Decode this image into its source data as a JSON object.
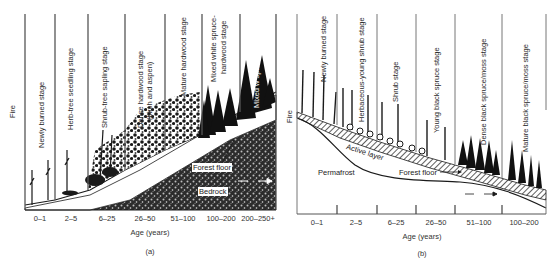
{
  "figure": {
    "panel_a": {
      "tag": "(a)",
      "fire_label": "Fire",
      "stages": [
        "Newly burned stage",
        "Herb-tree seedling stage",
        "Shrub-tree sapling stage",
        "Dense hardwood stage",
        "(birch and aspen)",
        "Mature hardwood stage",
        "Mixed white spruce-",
        "hardwood stage",
        "Mixed w spruce/moss stage"
      ],
      "age_ticks": [
        "0–1",
        "2–5",
        "6–25",
        "26–50",
        "51–100",
        "100–200",
        "200–250+"
      ],
      "x_axis_title": "Age (years)",
      "annotations": {
        "forest_floor": "Forest floor",
        "bedrock": "Bedrock",
        "north_arrow": "— N —"
      }
    },
    "panel_b": {
      "tag": "(b)",
      "fire_label": "Fire",
      "stages": [
        "Newly burned stage",
        "Herbaceous-young shrub stage",
        "Shrub stage",
        "Young black spruce stage",
        "Dense black spruce/moss stage",
        "Mature black spruce/moss stage"
      ],
      "age_ticks": [
        "0–1",
        "2–5",
        "6–25",
        "26–50",
        "51–100",
        "100–200"
      ],
      "x_axis_title": "Age (years)",
      "annotations": {
        "active_layer": "Active layer",
        "permafrost": "Permafrost",
        "forest_floor": "Forest floor",
        "north_arrow": "— N —"
      }
    },
    "colors": {
      "ink": "#1a1a1a",
      "divider": "#777777",
      "bedrock_fill": "#3a3a3a",
      "background": "#ffffff"
    }
  }
}
